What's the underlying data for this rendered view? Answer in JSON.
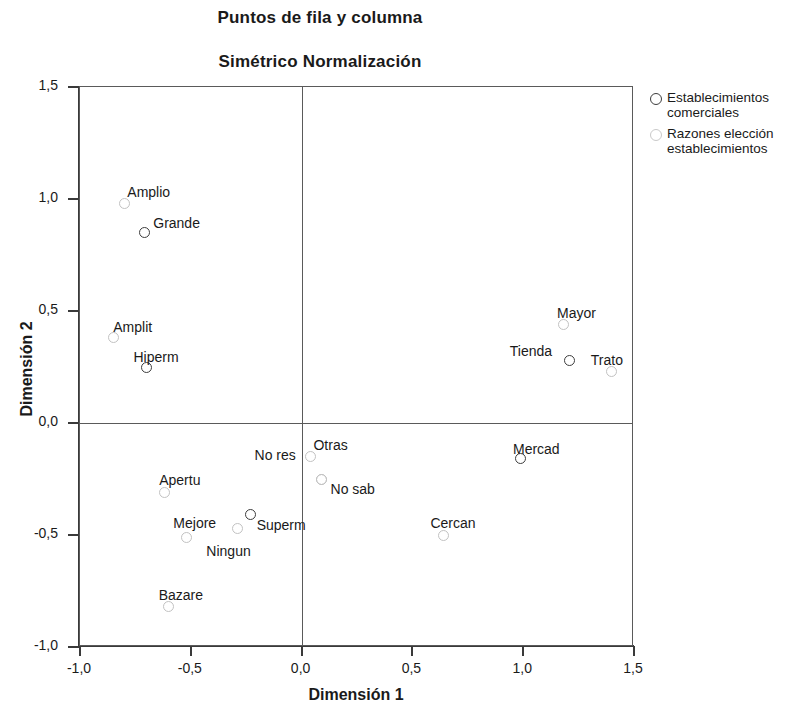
{
  "chart_data": {
    "type": "scatter",
    "title": "Puntos de fila y columna",
    "subtitle": "Simétrico Normalización",
    "xlabel": "Dimensión 1",
    "ylabel": "Dimensión 2",
    "xlim": [
      -1.0,
      1.5
    ],
    "ylim": [
      -1.0,
      1.5
    ],
    "xticks": [
      "-1,0",
      "-0,5",
      "0,0",
      "0,5",
      "1,0",
      "1,5"
    ],
    "xtick_values": [
      -1.0,
      -0.5,
      0.0,
      0.5,
      1.0,
      1.5
    ],
    "yticks": [
      "-1,0",
      "-0,5",
      "0,0",
      "0,5",
      "1,0",
      "1,5"
    ],
    "ytick_values": [
      -1.0,
      -0.5,
      0.0,
      0.5,
      1.0,
      1.5
    ],
    "grid": false,
    "zero_lines": true,
    "legend_position": "right",
    "series": [
      {
        "name": "Establecimientos comerciales",
        "key": "row",
        "marker": "open-circle",
        "color": "#3d3d3d",
        "points": [
          {
            "label": "Grande",
            "x": -0.71,
            "y": 0.85,
            "label_dx": 9,
            "label_dy": -18
          },
          {
            "label": "Hiperm",
            "x": -0.7,
            "y": 0.25,
            "label_dx": -13,
            "label_dy": -18
          },
          {
            "label": "Tienda",
            "x": 1.21,
            "y": 0.28,
            "label_dx": -60,
            "label_dy": -17
          },
          {
            "label": "Mercad",
            "x": 0.99,
            "y": -0.16,
            "label_dx": -8,
            "label_dy": -18
          },
          {
            "label": "Superm",
            "x": -0.23,
            "y": -0.41,
            "label_dx": 6,
            "label_dy": 2
          }
        ]
      },
      {
        "name": "Razones elección establecimientos",
        "key": "col",
        "marker": "open-circle",
        "color": "#c2c2c2",
        "points": [
          {
            "label": "Amplio",
            "x": -0.8,
            "y": 0.98,
            "label_dx": 3,
            "label_dy": -19
          },
          {
            "label": "Amplit",
            "x": -0.85,
            "y": 0.38,
            "label_dx": 0,
            "label_dy": -19
          },
          {
            "label": "Mayor",
            "x": 1.18,
            "y": 0.44,
            "label_dx": -6,
            "label_dy": -19
          },
          {
            "label": "Trato",
            "x": 1.4,
            "y": 0.23,
            "label_dx": -21,
            "label_dy": -19
          },
          {
            "label": "Otras",
            "x": 0.04,
            "y": -0.15,
            "label_dx": 3,
            "label_dy": -20
          },
          {
            "label": "No res",
            "x": 0.09,
            "y": -0.25,
            "label_dx": -67,
            "label_dy": -32
          },
          {
            "label": "No sab",
            "x": 0.09,
            "y": -0.25,
            "label_dx": 9,
            "label_dy": 2
          },
          {
            "label": "Apertu",
            "x": -0.62,
            "y": -0.31,
            "label_dx": -5,
            "label_dy": -20
          },
          {
            "label": "Mejore",
            "x": -0.29,
            "y": -0.47,
            "label_dx": -64,
            "label_dy": -13
          },
          {
            "label": "Ningun",
            "x": -0.52,
            "y": -0.51,
            "label_dx": 20,
            "label_dy": 6
          },
          {
            "label": "Cercan",
            "x": 0.64,
            "y": -0.5,
            "label_dx": -13,
            "label_dy": -20
          },
          {
            "label": "Bazare",
            "x": -0.6,
            "y": -0.82,
            "label_dx": -10,
            "label_dy": -20
          }
        ]
      }
    ]
  },
  "legend": {
    "items": [
      {
        "label_line1": "Establecimientos",
        "label_line2": "comerciales",
        "key": "row"
      },
      {
        "label_line1": "Razones elección",
        "label_line2": "establecimientos",
        "key": "col"
      }
    ]
  }
}
